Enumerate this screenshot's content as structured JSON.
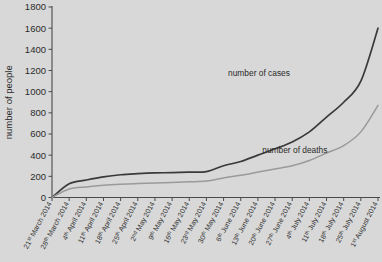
{
  "chart_data": {
    "type": "line",
    "title": "",
    "xlabel": "",
    "ylabel": "number of people",
    "ylim": [
      0,
      1800
    ],
    "ytick_values": [
      0,
      200,
      400,
      600,
      800,
      1000,
      1200,
      1400,
      1600,
      1800
    ],
    "grid": false,
    "legend_position": "inline-annotation",
    "categories": [
      "21st March 2014",
      "28th March 2014",
      "4th April 2014",
      "11th April 2014",
      "18th April 2014",
      "25th April 2014",
      "2nd May 2014",
      "9th May 2014",
      "16th May 2014",
      "23rd May 2014",
      "30th May 2014",
      "6th June 2014",
      "13th June 2014",
      "20th June 2014",
      "27th June 2014",
      "4th July 2014",
      "11th July 2014",
      "18th July 2014",
      "25th July 2014",
      "1st August 2014"
    ],
    "series": [
      {
        "name": "number of cases",
        "color": "#3a3a3a",
        "values": [
          0,
          130,
          165,
          195,
          215,
          225,
          232,
          235,
          240,
          245,
          300,
          340,
          400,
          460,
          525,
          620,
          760,
          900,
          1100,
          1600
        ]
      },
      {
        "name": "number of deaths",
        "color": "#9a9a9a",
        "values": [
          0,
          80,
          100,
          115,
          125,
          132,
          138,
          142,
          148,
          155,
          185,
          210,
          240,
          270,
          300,
          350,
          420,
          490,
          620,
          870
        ]
      }
    ],
    "annotations": [
      {
        "text": "number of cases",
        "x_frac": 0.635,
        "y_value": 1150
      },
      {
        "text": "number of deaths",
        "x_frac": 0.745,
        "y_value": 420
      }
    ]
  },
  "axis": {
    "y_title": "number of people"
  }
}
